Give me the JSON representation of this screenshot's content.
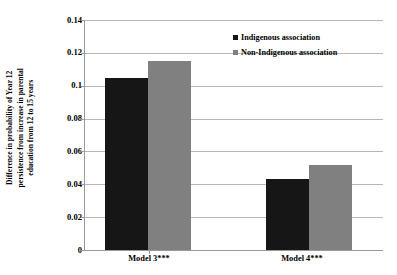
{
  "chart_data": {
    "type": "bar",
    "title": "",
    "subtitle": "",
    "xlabel": "",
    "ylabel": "Difference in probability of Year 12 persistence from increase in parental education from 12 to 15 years",
    "ylabel_lines": [
      "Difference in probability of Year 12",
      "persistence from increase in parental",
      "education from 12 to 15 years"
    ],
    "categories": [
      "Model 3***",
      "Model 4***"
    ],
    "series": [
      {
        "name": "Indigenous association",
        "color": "#161616",
        "values": [
          0.105,
          0.043
        ]
      },
      {
        "name": "Non-Indigenous association",
        "color": "#808080",
        "values": [
          0.115,
          0.052
        ]
      }
    ],
    "ylim": [
      0,
      0.14
    ],
    "ytick_values": [
      0,
      0.02,
      0.04,
      0.06,
      0.08,
      0.1,
      0.12,
      0.14
    ],
    "ytick_labels": [
      "0",
      "0.02",
      "0.04",
      "0.06",
      "0.08",
      "0.1",
      "0.12",
      "0.14"
    ],
    "grid": true,
    "grid_axis": "y",
    "legend": {
      "position": "top-right-inside",
      "entries": [
        {
          "label": "Indigenous association",
          "swatch": "legend-swatch-icon",
          "color": "#161616"
        },
        {
          "label": "Non-Indigenous association",
          "swatch": "legend-swatch-icon",
          "color": "#808080"
        }
      ]
    },
    "colors": {
      "indigenous": "#161616",
      "non_indigenous": "#808080",
      "gridline": "#b7b7b7",
      "axis": "#9a9a9a",
      "background": "#ffffff",
      "text": "#000000"
    }
  }
}
